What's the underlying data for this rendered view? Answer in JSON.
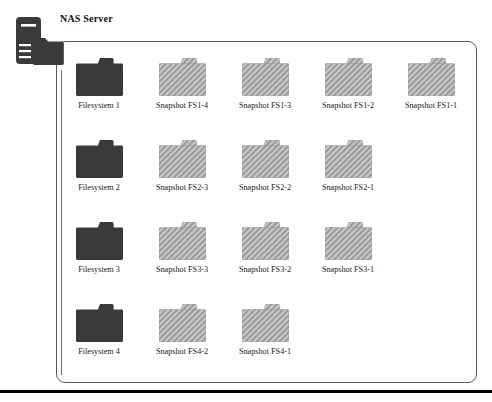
{
  "diagram": {
    "title": "NAS Server",
    "server_icon": "nas-server-icon",
    "colors": {
      "filesystem_fill": "#3a3a3c",
      "snapshot_fill": "#9a9a9c",
      "snapshot_hatch": "#c9c9cb",
      "container_border": "#58585a",
      "connector": "#6d6d70",
      "rule": "#000000",
      "text": "#111111"
    },
    "rows": [
      {
        "id": "row-fs1",
        "nodes": [
          {
            "label": "Filesystem 1",
            "kind": "filesystem",
            "icon": "folder-icon"
          },
          {
            "label": "Snapshot FS1-4",
            "kind": "snapshot",
            "icon": "folder-icon"
          },
          {
            "label": "Snapshot FS1-3",
            "kind": "snapshot",
            "icon": "folder-icon"
          },
          {
            "label": "Snapshot FS1-2",
            "kind": "snapshot",
            "icon": "folder-icon"
          },
          {
            "label": "Snapshot FS1-1",
            "kind": "snapshot",
            "icon": "folder-icon"
          }
        ]
      },
      {
        "id": "row-fs2",
        "nodes": [
          {
            "label": "Filesystem 2",
            "kind": "filesystem",
            "icon": "folder-icon"
          },
          {
            "label": "Snapshot FS2-3",
            "kind": "snapshot",
            "icon": "folder-icon"
          },
          {
            "label": "Snapshot FS2-2",
            "kind": "snapshot",
            "icon": "folder-icon"
          },
          {
            "label": "Snapshot FS2-1",
            "kind": "snapshot",
            "icon": "folder-icon"
          }
        ]
      },
      {
        "id": "row-fs3",
        "nodes": [
          {
            "label": "Filesystem 3",
            "kind": "filesystem",
            "icon": "folder-icon"
          },
          {
            "label": "Snapshot FS3-3",
            "kind": "snapshot",
            "icon": "folder-icon"
          },
          {
            "label": "Snapshot FS3-2",
            "kind": "snapshot",
            "icon": "folder-icon"
          },
          {
            "label": "Snapshot FS3-1",
            "kind": "snapshot",
            "icon": "folder-icon"
          }
        ]
      },
      {
        "id": "row-fs4",
        "nodes": [
          {
            "label": "Filesystem 4",
            "kind": "filesystem",
            "icon": "folder-icon"
          },
          {
            "label": "Snapshot FS4-2",
            "kind": "snapshot",
            "icon": "folder-icon"
          },
          {
            "label": "Snapshot FS4-1",
            "kind": "snapshot",
            "icon": "folder-icon"
          }
        ]
      }
    ],
    "layout": {
      "col_x": [
        75,
        158,
        241,
        324,
        407
      ],
      "row_y": [
        58,
        140,
        222,
        304
      ]
    }
  }
}
